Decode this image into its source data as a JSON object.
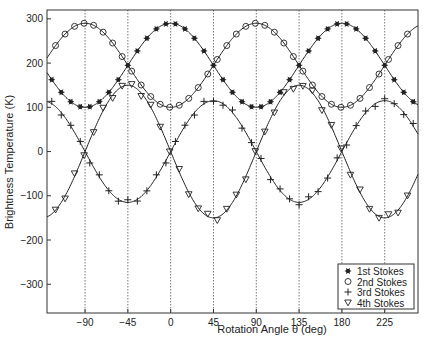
{
  "chart_data": {
    "type": "line",
    "title": "",
    "xlabel": "Rotation Angle θ (deg)",
    "ylabel": "Brightness Temperature (K)",
    "xlim": [
      -130,
      260
    ],
    "ylim": [
      -365,
      320
    ],
    "xticks": [
      -90,
      -45,
      0,
      45,
      90,
      135,
      180,
      225
    ],
    "yticks": [
      300,
      200,
      100,
      0,
      -100,
      -200,
      -300
    ],
    "grid": "vertical dotted lines at x ticks",
    "legend_position": "lower right",
    "series": [
      {
        "name": "1st Stokes",
        "marker": "asterisk",
        "model": "195 + 95*cos(2θ)",
        "x": [
          -90,
          -45,
          0,
          45,
          90,
          135,
          180,
          225
        ],
        "values": [
          100,
          195,
          290,
          195,
          100,
          195,
          290,
          195
        ]
      },
      {
        "name": "2nd Stokes",
        "marker": "circle",
        "model": "195 - 95*cos(2θ)",
        "x": [
          -90,
          -45,
          0,
          45,
          90,
          135,
          180,
          225
        ],
        "values": [
          290,
          195,
          100,
          195,
          290,
          195,
          100,
          195
        ]
      },
      {
        "name": "3rd Stokes",
        "marker": "plus",
        "model": "115*sin(2θ)",
        "x": [
          -90,
          -45,
          0,
          45,
          90,
          135,
          180,
          225
        ],
        "values": [
          0,
          -115,
          0,
          115,
          0,
          -115,
          0,
          115
        ]
      },
      {
        "name": "4th Stokes",
        "marker": "triangle-down",
        "model": "-150*sin(2θ)",
        "x": [
          -90,
          -45,
          0,
          45,
          90,
          135,
          180,
          225
        ],
        "values": [
          0,
          150,
          0,
          -150,
          0,
          150,
          0,
          -150
        ]
      }
    ]
  },
  "axes": {
    "xlabel": "Rotation Angle θ (deg)",
    "ylabel": "Brightness Temperature (K)"
  },
  "legend": {
    "items": [
      {
        "label": "1st Stokes",
        "symbol": "✱"
      },
      {
        "label": "2nd Stokes",
        "symbol": "o"
      },
      {
        "label": "3rd Stokes",
        "symbol": "+"
      },
      {
        "label": "4th Stokes",
        "symbol": "▽"
      }
    ]
  }
}
